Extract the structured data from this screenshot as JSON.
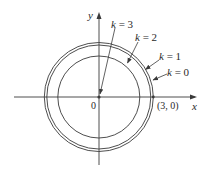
{
  "figure": {
    "type": "level curves diagram",
    "axes": {
      "x_label": "x",
      "y_label": "y",
      "origin_label": "0",
      "point_label": "(3, 0)"
    },
    "curves": [
      {
        "k": 0,
        "label": "k = 0",
        "radius_px": 54.5
      },
      {
        "k": 1,
        "label": "k = 1",
        "radius_px": 52
      },
      {
        "k": 2,
        "label": "k = 2",
        "radius_px": 41
      },
      {
        "k": 3,
        "label": "k = 3",
        "radius_px": 0
      }
    ],
    "labels": {
      "k0": {
        "k": "k",
        "eq": " = 0"
      },
      "k1": {
        "k": "k",
        "eq": " = 1"
      },
      "k2": {
        "k": "k",
        "eq": " = 2"
      },
      "k3": {
        "k": "k",
        "eq": " = 3"
      }
    },
    "colors": {
      "stroke": "#3a3a3a",
      "text": "#2a2a2a",
      "background": "#ffffff"
    }
  }
}
